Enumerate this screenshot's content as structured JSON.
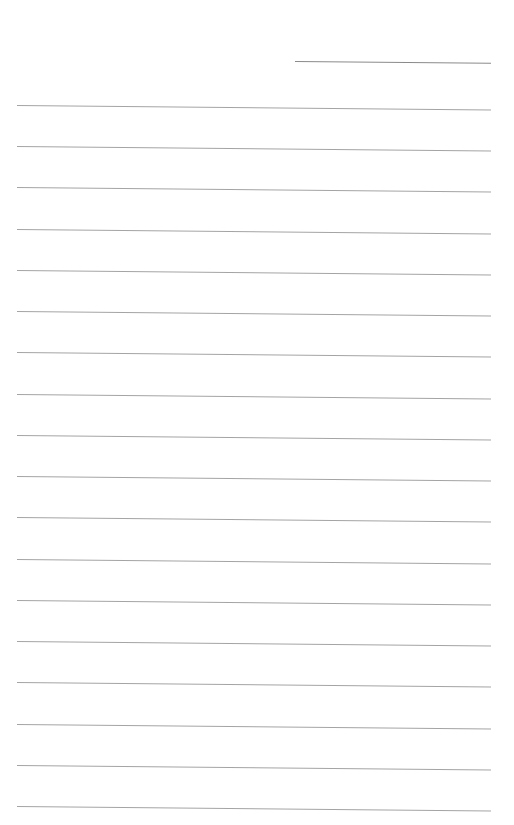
{
  "page": {
    "type": "lined-paper",
    "background": "#ffffff",
    "line_color": "#a4a4a4",
    "header_line_color": "#8a8a8a"
  },
  "header_line": {
    "x": 295,
    "y": 61,
    "width": 196
  },
  "rules": [
    {
      "y": 105
    },
    {
      "y": 146
    },
    {
      "y": 187
    },
    {
      "y": 229
    },
    {
      "y": 270
    },
    {
      "y": 311
    },
    {
      "y": 352
    },
    {
      "y": 394
    },
    {
      "y": 435
    },
    {
      "y": 476
    },
    {
      "y": 517
    },
    {
      "y": 559
    },
    {
      "y": 600
    },
    {
      "y": 641
    },
    {
      "y": 682
    },
    {
      "y": 724
    },
    {
      "y": 765
    },
    {
      "y": 806
    }
  ]
}
